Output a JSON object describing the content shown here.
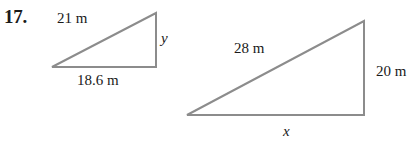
{
  "problem": {
    "number": "17."
  },
  "style": {
    "stroke_color": "#8c8c8c",
    "text_color": "#1a1a1a",
    "background": "#ffffff",
    "stroke_width": 2
  },
  "figures": [
    {
      "id": "left-triangle",
      "name": "small-right-triangle",
      "vertices": {
        "left": [
          52,
          67
        ],
        "right_bottom": [
          156,
          67
        ],
        "apex": [
          156,
          13
        ]
      },
      "labels": {
        "hypotenuse": "21 m",
        "base": "18.6 m",
        "vertical": "y"
      }
    },
    {
      "id": "right-triangle",
      "name": "large-right-triangle",
      "vertices": {
        "left": [
          187,
          115
        ],
        "right_bottom": [
          364,
          115
        ],
        "apex": [
          364,
          21
        ]
      },
      "labels": {
        "hypotenuse": "28 m",
        "base": "x",
        "vertical": "20 m"
      }
    }
  ]
}
